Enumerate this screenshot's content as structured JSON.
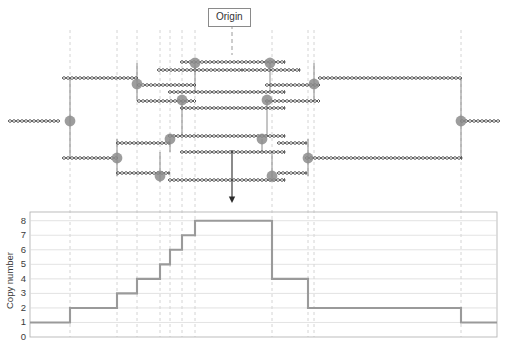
{
  "figure": {
    "title_label": "Origin"
  },
  "diagram": {
    "origin_label": "Origin",
    "origin_box": {
      "x": 208,
      "y": 8,
      "w": 48,
      "h": 17
    },
    "origin_stem": {
      "x": 232,
      "y1": 25,
      "y2": 55
    },
    "arrow": {
      "x": 232,
      "y1": 150,
      "y2": 203
    },
    "strand_color": "#4d4d4d",
    "fork_color": "#8c8c8c",
    "connector_color": "#7d7d7d",
    "guide_color": "#c9c9c9",
    "strands": [
      {
        "name": "outer-left-tail",
        "x1": 8,
        "x2": 60,
        "y": 121
      },
      {
        "name": "outer-right-tail",
        "x1": 460,
        "x2": 500,
        "y": 121
      },
      {
        "name": "level1-top-left",
        "x1": 62,
        "x2": 138,
        "y": 78
      },
      {
        "name": "level1-bottom-left",
        "x1": 62,
        "x2": 118,
        "y": 158
      },
      {
        "name": "level1-top-right",
        "x1": 318,
        "x2": 462,
        "y": 78
      },
      {
        "name": "level1-bottom-right",
        "x1": 305,
        "x2": 462,
        "y": 158
      },
      {
        "name": "level2-top-left",
        "x1": 137,
        "x2": 196,
        "y": 85
      },
      {
        "name": "level2-bottom-left",
        "x1": 116,
        "x2": 170,
        "y": 173
      },
      {
        "name": "level2-top-right",
        "x1": 265,
        "x2": 320,
        "y": 85
      },
      {
        "name": "level2-bottom-right",
        "x1": 277,
        "x2": 307,
        "y": 173
      },
      {
        "name": "level3-top-left",
        "x1": 137,
        "x2": 196,
        "y": 101
      },
      {
        "name": "level3-bottom-left",
        "x1": 116,
        "x2": 170,
        "y": 143
      },
      {
        "name": "level3-top-right",
        "x1": 265,
        "x2": 320,
        "y": 101
      },
      {
        "name": "level3-bottom-right",
        "x1": 277,
        "x2": 307,
        "y": 143
      },
      {
        "name": "inner-top-a",
        "x1": 180,
        "x2": 285,
        "y": 62
      },
      {
        "name": "inner-top-b",
        "x1": 168,
        "x2": 285,
        "y": 92
      },
      {
        "name": "inner-mid-a",
        "x1": 180,
        "x2": 285,
        "y": 108
      },
      {
        "name": "inner-mid-b",
        "x1": 168,
        "x2": 285,
        "y": 136
      },
      {
        "name": "inner-bot-a",
        "x1": 180,
        "x2": 285,
        "y": 152
      },
      {
        "name": "inner-bot-b",
        "x1": 168,
        "x2": 285,
        "y": 180
      },
      {
        "name": "bubble-top-left-a",
        "x1": 157,
        "x2": 243,
        "y": 70
      },
      {
        "name": "bubble-top-right-a",
        "x1": 243,
        "x2": 300,
        "y": 70
      }
    ],
    "forks": [
      {
        "name": "fork-outer-left",
        "x": 70,
        "y": 121
      },
      {
        "name": "fork-outer-right",
        "x": 461,
        "y": 121
      },
      {
        "name": "fork-l1-top-left",
        "x": 137,
        "y": 84
      },
      {
        "name": "fork-l1-bottom-left",
        "x": 117,
        "y": 158
      },
      {
        "name": "fork-l1-top-right",
        "x": 314,
        "y": 84
      },
      {
        "name": "fork-l1-bottom-right",
        "x": 308,
        "y": 158
      },
      {
        "name": "fork-l2-top-left",
        "x": 195,
        "y": 63
      },
      {
        "name": "fork-l2-top-right",
        "x": 270,
        "y": 63
      },
      {
        "name": "fork-l3-top-left",
        "x": 182,
        "y": 100
      },
      {
        "name": "fork-l3-top-right",
        "x": 267,
        "y": 100
      },
      {
        "name": "fork-l4-bottom-left",
        "x": 170,
        "y": 139
      },
      {
        "name": "fork-l4-bottom-right",
        "x": 262,
        "y": 139
      },
      {
        "name": "fork-l5-bottom-left",
        "x": 160,
        "y": 176
      },
      {
        "name": "fork-l5-bottom-right",
        "x": 272,
        "y": 176
      }
    ],
    "guides": [
      {
        "name": "guide-a",
        "x": 70
      },
      {
        "name": "guide-b",
        "x": 117
      },
      {
        "name": "guide-c",
        "x": 137
      },
      {
        "name": "guide-d",
        "x": 160
      },
      {
        "name": "guide-e",
        "x": 170
      },
      {
        "name": "guide-f",
        "x": 182
      },
      {
        "name": "guide-g",
        "x": 195
      },
      {
        "name": "guide-h",
        "x": 272
      },
      {
        "name": "guide-i",
        "x": 308
      },
      {
        "name": "guide-j",
        "x": 314
      },
      {
        "name": "guide-k",
        "x": 461
      }
    ]
  },
  "chart_data": {
    "type": "line",
    "subtype": "step",
    "title": "",
    "xlabel": "",
    "ylabel": "Copy number",
    "ylim": [
      0,
      8.6
    ],
    "yticks": [
      0,
      1,
      2,
      3,
      4,
      5,
      6,
      7,
      8
    ],
    "ytick_labels": [
      "0",
      "1",
      "2",
      "3",
      "4",
      "5",
      "6",
      "7",
      "8"
    ],
    "grid": true,
    "grid_axis": "y",
    "legend": null,
    "xlim": [
      30,
      497
    ],
    "x_breakpoints": [
      30,
      70,
      117,
      137,
      160,
      170,
      182,
      195,
      272,
      308,
      461,
      497
    ],
    "step_values": [
      1,
      2,
      3,
      4,
      5,
      6,
      7,
      8,
      4,
      2,
      1
    ],
    "points": [
      {
        "x": 30,
        "y": 1
      },
      {
        "x": 70,
        "y": 1
      },
      {
        "x": 70,
        "y": 2
      },
      {
        "x": 117,
        "y": 2
      },
      {
        "x": 117,
        "y": 3
      },
      {
        "x": 137,
        "y": 3
      },
      {
        "x": 137,
        "y": 4
      },
      {
        "x": 160,
        "y": 4
      },
      {
        "x": 160,
        "y": 5
      },
      {
        "x": 170,
        "y": 5
      },
      {
        "x": 170,
        "y": 6
      },
      {
        "x": 182,
        "y": 6
      },
      {
        "x": 182,
        "y": 7
      },
      {
        "x": 195,
        "y": 7
      },
      {
        "x": 195,
        "y": 8
      },
      {
        "x": 272,
        "y": 8
      },
      {
        "x": 272,
        "y": 4
      },
      {
        "x": 308,
        "y": 4
      },
      {
        "x": 308,
        "y": 2
      },
      {
        "x": 461,
        "y": 2
      },
      {
        "x": 461,
        "y": 1
      },
      {
        "x": 497,
        "y": 1
      }
    ],
    "line_color": "#9a9a9a",
    "grid_color": "#d8d8d8",
    "frame_color": "#b5b5b5",
    "plot_box": {
      "x": 30,
      "y": 212,
      "w": 467,
      "h": 125
    }
  }
}
